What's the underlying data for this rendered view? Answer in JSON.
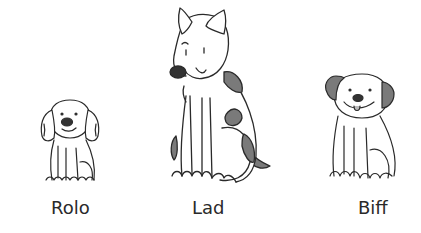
{
  "dogs": [
    {
      "name": "Rolo",
      "size": "small",
      "description": "small fluffy puppy with droopy ears"
    },
    {
      "name": "Lad",
      "size": "large",
      "description": "tall dog with pointed ears and dark spots"
    },
    {
      "name": "Biff",
      "size": "medium",
      "description": "puppy with dark ears and tongue out"
    }
  ],
  "colors": {
    "line": "#2a2a2a",
    "spot": "#7a7a7a",
    "nose": "#333333",
    "background": "#ffffff"
  }
}
